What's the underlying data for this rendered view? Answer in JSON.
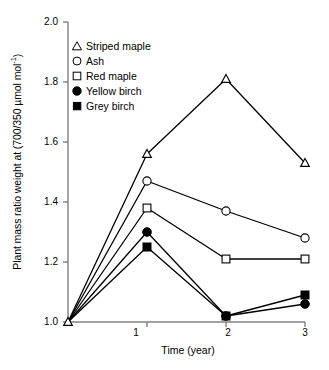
{
  "chart_data": {
    "type": "line",
    "title": "",
    "xlabel": "Time (year)",
    "ylabel": "Plant mass ratio weight at (700/350 µmol mol⁻¹)",
    "ylabel_main": "Plant mass ratio weight at (700/350 µmol mol",
    "ylabel_sup": "-1",
    "ylabel_tail": ")",
    "x": [
      0,
      1,
      2,
      3
    ],
    "xlim": [
      0,
      3
    ],
    "ylim": [
      1.0,
      2.0
    ],
    "grid": false,
    "legend_position": "upper-left",
    "xticks": [
      1,
      2,
      3
    ],
    "xtick_labels": [
      "1",
      "2",
      "3"
    ],
    "yticks": [
      1.0,
      1.2,
      1.4,
      1.6,
      1.8,
      2.0
    ],
    "ytick_labels": [
      "1.0",
      "1.2",
      "1.4",
      "1.6",
      "1.8",
      "2.0"
    ],
    "series": [
      {
        "name": "Striped maple",
        "marker": "open-triangle",
        "color": "#000000",
        "values": [
          1.0,
          1.56,
          1.81,
          1.53
        ]
      },
      {
        "name": "Ash",
        "marker": "open-circle",
        "color": "#000000",
        "values": [
          1.0,
          1.47,
          1.37,
          1.28
        ]
      },
      {
        "name": "Red maple",
        "marker": "open-square",
        "color": "#000000",
        "values": [
          1.0,
          1.38,
          1.21,
          1.21
        ]
      },
      {
        "name": "Yellow birch",
        "marker": "filled-circle",
        "color": "#000000",
        "values": [
          1.0,
          1.3,
          1.02,
          1.06
        ]
      },
      {
        "name": "Grey birch",
        "marker": "filled-square",
        "color": "#000000",
        "values": [
          1.0,
          1.25,
          1.02,
          1.09
        ]
      }
    ]
  },
  "legend": {
    "items": [
      {
        "label": "Striped maple",
        "marker": "open-triangle"
      },
      {
        "label": "Ash",
        "marker": "open-circle"
      },
      {
        "label": "Red maple",
        "marker": "open-square"
      },
      {
        "label": "Yellow birch",
        "marker": "filled-circle"
      },
      {
        "label": "Grey birch",
        "marker": "filled-square"
      }
    ]
  },
  "axes": {
    "axis_color": "#808080",
    "line_color": "#000000"
  }
}
